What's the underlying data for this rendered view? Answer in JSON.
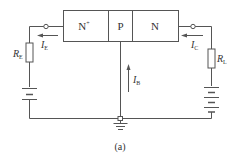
{
  "diagram": {
    "regions": [
      {
        "label": "N",
        "sup": "+"
      },
      {
        "label": "P"
      },
      {
        "label": "N"
      }
    ],
    "labels": {
      "re": {
        "main": "R",
        "sub": "E"
      },
      "rl": {
        "main": "R",
        "sub": "L"
      },
      "ie": {
        "main": "I",
        "sub": "E"
      },
      "ic": {
        "main": "I",
        "sub": "C"
      },
      "ib": {
        "main": "I",
        "sub": "B"
      }
    },
    "caption": "(a)",
    "colors": {
      "line": "#555555",
      "text": "#333333"
    }
  }
}
